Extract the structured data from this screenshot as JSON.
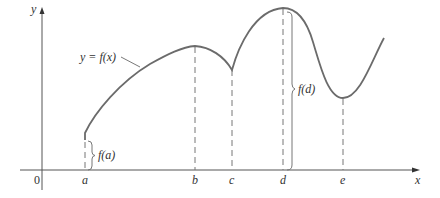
{
  "diagram": {
    "axes": {
      "x_label": "x",
      "y_label": "y",
      "origin_label": "0"
    },
    "curve_label": "y = f(x)",
    "points": [
      {
        "name": "a",
        "label": "a",
        "description": "left endpoint"
      },
      {
        "name": "b",
        "label": "b",
        "description": "local maximum"
      },
      {
        "name": "c",
        "label": "c",
        "description": "cusp / local minimum"
      },
      {
        "name": "d",
        "label": "d",
        "description": "absolute maximum"
      },
      {
        "name": "e",
        "label": "e",
        "description": "local minimum"
      }
    ],
    "braces": [
      {
        "name": "f-a",
        "label": "f(a)"
      },
      {
        "name": "f-d",
        "label": "f(d)"
      }
    ],
    "colors": {
      "curve": "#6b6b6b",
      "axis": "#555555",
      "text": "#333333"
    }
  }
}
